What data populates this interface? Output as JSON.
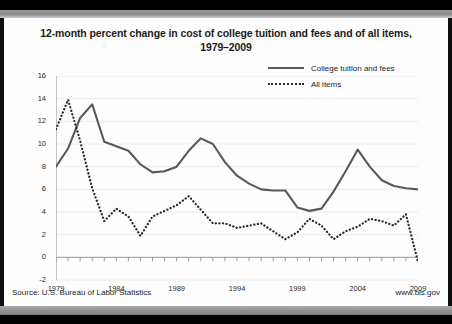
{
  "footer": {
    "source": "Source: U.S. Bureau of Labor Statistics",
    "url": "www.bls.gov"
  },
  "colors": {
    "tuition_line": "#595959",
    "allitems_line": "#2a2a2a",
    "grid": "#ececec",
    "axis": "#9a9a9a",
    "card_bg": "#fdfdfd",
    "frame": "#000000"
  },
  "chart_data": {
    "type": "line",
    "title": "12-month percent change in cost of college tuition and fees and of all items, 1979–2009",
    "title_line1": "12-month percent change in cost of college tuition and fees and of all items,",
    "title_line2": "1979–2009",
    "xlabel": "",
    "ylabel": "Percent change",
    "ylim": [
      -2,
      16
    ],
    "xlim": [
      1979,
      2009
    ],
    "ytick_step": 2,
    "yticks": [
      16,
      14,
      12,
      10,
      8,
      6,
      4,
      2,
      0,
      -2
    ],
    "xticks": [
      1979,
      1984,
      1989,
      1994,
      1999,
      2004,
      2009
    ],
    "x_minor_step": 1,
    "grid": "horizontal",
    "legend_position": "top-right",
    "x": [
      1979,
      1980,
      1981,
      1982,
      1983,
      1984,
      1985,
      1986,
      1987,
      1988,
      1989,
      1990,
      1991,
      1992,
      1993,
      1994,
      1995,
      1996,
      1997,
      1998,
      1999,
      2000,
      2001,
      2002,
      2003,
      2004,
      2005,
      2006,
      2007,
      2008,
      2009
    ],
    "series": [
      {
        "name": "College tuition and fees",
        "style": "solid",
        "color": "#595959",
        "values": [
          8.0,
          9.6,
          12.3,
          13.5,
          10.2,
          9.8,
          9.4,
          8.2,
          7.5,
          7.6,
          8.0,
          9.4,
          10.5,
          10.0,
          8.4,
          7.2,
          6.5,
          6.0,
          5.9,
          5.9,
          4.4,
          4.1,
          4.3,
          5.8,
          7.6,
          9.5,
          8.0,
          6.8,
          6.3,
          6.1,
          6.0
        ]
      },
      {
        "name": "All items",
        "style": "dotted",
        "color": "#2a2a2a",
        "values": [
          11.3,
          13.9,
          10.3,
          6.1,
          3.2,
          4.3,
          3.6,
          1.9,
          3.6,
          4.1,
          4.6,
          5.4,
          4.2,
          3.0,
          3.0,
          2.6,
          2.8,
          3.0,
          2.3,
          1.6,
          2.2,
          3.4,
          2.8,
          1.6,
          2.3,
          2.7,
          3.4,
          3.2,
          2.8,
          3.8,
          -0.4
        ]
      }
    ],
    "legend": [
      {
        "label": "College tuition and fees",
        "style": "solid"
      },
      {
        "label": "All items",
        "style": "dotted"
      }
    ]
  }
}
